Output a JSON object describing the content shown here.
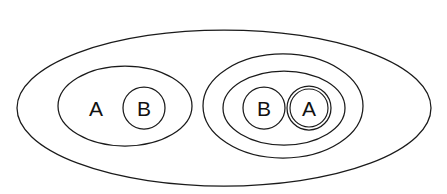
{
  "diagram": {
    "type": "nested-set-diagram",
    "background_color": "#ffffff",
    "stroke_color": "#1a1a1a",
    "label_color": "#111111",
    "canvas": {
      "width": 447,
      "height": 194
    },
    "universe": {
      "name": "outer-ellipse",
      "cx": 224,
      "cy": 108,
      "rx": 207,
      "ry": 78
    },
    "groups": [
      {
        "name": "left-group",
        "container": {
          "cx": 125,
          "cy": 106,
          "rx": 67,
          "ry": 40
        },
        "members": [
          {
            "label": "A",
            "shape": "text-only",
            "x": 96,
            "y": 108
          },
          {
            "label": "B",
            "shape": "circle",
            "cx": 144,
            "cy": 108,
            "r": 21,
            "rings": 1
          }
        ]
      },
      {
        "name": "right-group",
        "container": {
          "cx": 283,
          "cy": 106,
          "rx": 80,
          "ry": 52
        },
        "inner_container": {
          "cx": 284,
          "cy": 108,
          "rx": 61,
          "ry": 37
        },
        "members": [
          {
            "label": "B",
            "shape": "circle",
            "cx": 264,
            "cy": 108,
            "r": 21,
            "rings": 1
          },
          {
            "label": "A",
            "shape": "circle",
            "cx": 309,
            "cy": 108,
            "r": 22,
            "rings": 2,
            "inner_r": 19
          }
        ]
      }
    ],
    "labels": {
      "left_a": "A",
      "left_b": "B",
      "right_b": "B",
      "right_a": "A"
    }
  }
}
